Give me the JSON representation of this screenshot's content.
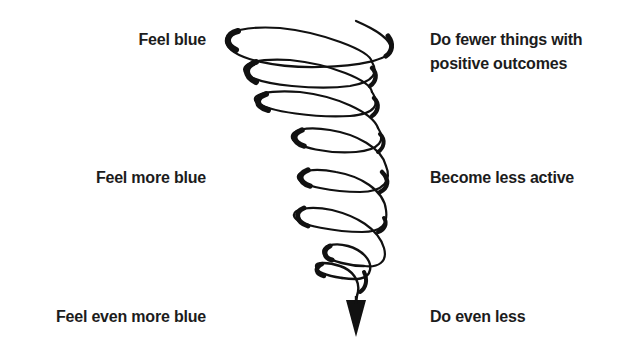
{
  "diagram": {
    "type": "downward spiral",
    "left_labels": [
      {
        "text": "Feel blue"
      },
      {
        "text": "Feel more blue"
      },
      {
        "text": "Feel even more blue"
      }
    ],
    "right_labels": [
      {
        "line1": "Do fewer things with",
        "line2": "positive outcomes"
      },
      {
        "line1": "Become less active"
      },
      {
        "line1": "Do even less"
      }
    ],
    "colors": {
      "ink": "#111111",
      "text": "#1c1c1c",
      "background": "#ffffff"
    }
  }
}
